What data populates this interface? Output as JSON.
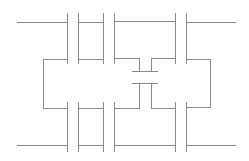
{
  "diagram": {
    "type": "capacitor-network",
    "canvas": {
      "width": 249,
      "height": 161,
      "background": "#ffffff"
    },
    "line_color": "#8a8a8a",
    "components": [
      {
        "id": "C1-top",
        "kind": "capacitor",
        "plates_x": [
          67,
          78
        ],
        "y_range": [
          13,
          64
        ]
      },
      {
        "id": "C2-top",
        "kind": "capacitor",
        "plates_x": [
          103,
          114
        ],
        "y_range": [
          13,
          64
        ]
      },
      {
        "id": "C3-top",
        "kind": "capacitor",
        "plates_x": [
          176,
          187
        ],
        "y_range": [
          13,
          64
        ]
      },
      {
        "id": "C1-bottom",
        "kind": "capacitor",
        "plates_x": [
          67,
          78
        ],
        "y_range": [
          102,
          152
        ]
      },
      {
        "id": "C2-bottom",
        "kind": "capacitor",
        "plates_x": [
          103,
          114
        ],
        "y_range": [
          102,
          152
        ]
      },
      {
        "id": "C3-bottom",
        "kind": "capacitor",
        "plates_x": [
          176,
          187
        ],
        "y_range": [
          102,
          152
        ]
      },
      {
        "id": "C-middle",
        "kind": "capacitor",
        "orientation": "horizontal-plates",
        "plates_y": [
          71,
          83
        ],
        "x_range": [
          132,
          158
        ]
      }
    ],
    "terminals": [
      {
        "id": "top-left",
        "x": 17,
        "y": 22
      },
      {
        "id": "top-right",
        "x": 236,
        "y": 22
      },
      {
        "id": "bottom-left",
        "x": 17,
        "y": 145
      },
      {
        "id": "bottom-right",
        "x": 236,
        "y": 145
      }
    ]
  }
}
